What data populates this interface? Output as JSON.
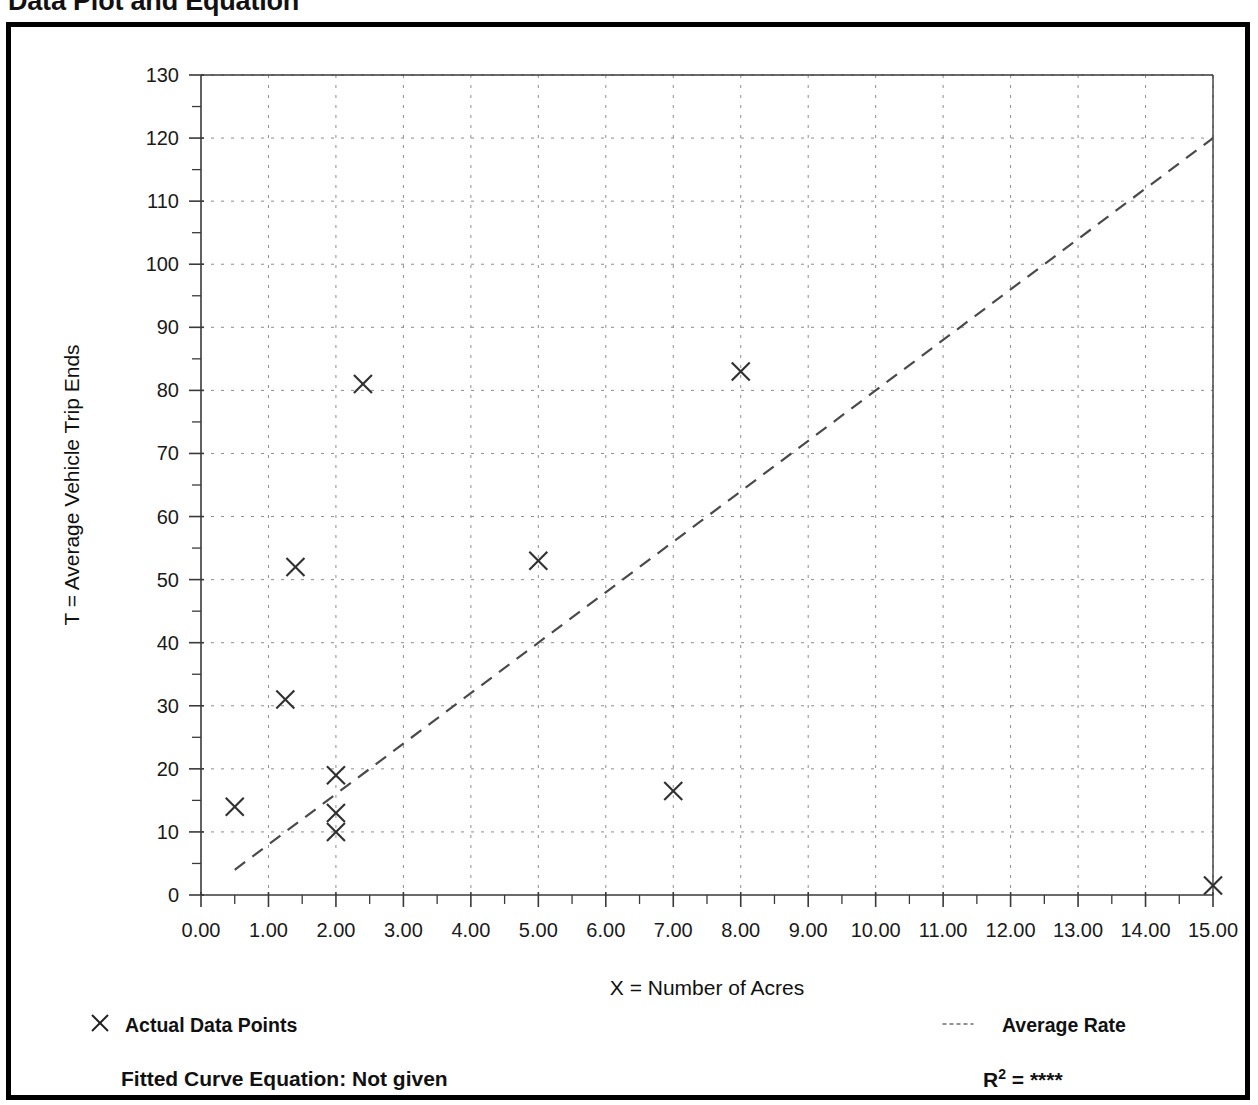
{
  "title": "Data Plot and Equation",
  "legend": {
    "actual_label": "Actual Data Points",
    "actual_marker": "x-marker-icon",
    "average_label": "Average Rate",
    "average_marker": "dashed-line-icon"
  },
  "footer": {
    "equation_label": "Fitted Curve Equation:  Not given",
    "r2_prefix": "R",
    "r2_exponent": "2",
    "r2_value": "= ****"
  },
  "chart_data": {
    "type": "scatter",
    "title": "Data Plot and Equation",
    "xlabel": "X = Number of Acres",
    "ylabel": "T = Average Vehicle Trip Ends",
    "xlim": [
      0,
      15
    ],
    "ylim": [
      0,
      130
    ],
    "xticks": [
      "0.00",
      "1.00",
      "2.00",
      "3.00",
      "4.00",
      "5.00",
      "6.00",
      "7.00",
      "8.00",
      "9.00",
      "10.00",
      "11.00",
      "12.00",
      "13.00",
      "14.00",
      "15.00"
    ],
    "xtick_values": [
      0,
      1,
      2,
      3,
      4,
      5,
      6,
      7,
      8,
      9,
      10,
      11,
      12,
      13,
      14,
      15
    ],
    "yticks": [
      "0",
      "10",
      "20",
      "30",
      "40",
      "50",
      "60",
      "70",
      "80",
      "90",
      "100",
      "110",
      "120",
      "130"
    ],
    "ytick_values": [
      0,
      10,
      20,
      30,
      40,
      50,
      60,
      70,
      80,
      90,
      100,
      110,
      120,
      130
    ],
    "x_minor_step": 0.5,
    "y_minor_step": 5,
    "grid": true,
    "legend_position": "below-plot",
    "series": [
      {
        "name": "Actual Data Points",
        "type": "scatter",
        "marker": "x",
        "points": [
          [
            0.5,
            14.0
          ],
          [
            1.25,
            31.0
          ],
          [
            1.4,
            52.0
          ],
          [
            2.0,
            19.0
          ],
          [
            2.0,
            13.0
          ],
          [
            2.0,
            10.0
          ],
          [
            2.4,
            81.0
          ],
          [
            5.0,
            53.0
          ],
          [
            7.0,
            16.5
          ],
          [
            8.0,
            83.0
          ],
          [
            15.0,
            1.5
          ]
        ]
      },
      {
        "name": "Average Rate",
        "type": "line",
        "style": "dashed",
        "endpoints": [
          [
            0.5,
            4.0
          ],
          [
            15.0,
            120.0
          ]
        ]
      }
    ]
  }
}
